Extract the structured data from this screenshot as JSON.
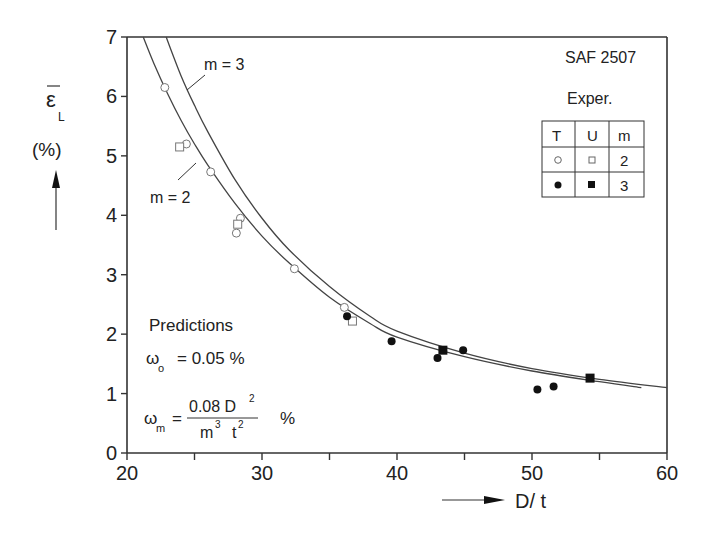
{
  "chart_data": {
    "type": "scatter",
    "title": "SAF 2507",
    "xlabel": "D/ t",
    "ylabel": "ε̄L (%)",
    "ylabel_symbol": "ε",
    "ylabel_sub": "L",
    "ylabel_unit": "(%)",
    "xlim": [
      20,
      60
    ],
    "ylim": [
      0,
      7
    ],
    "xticks": [
      20,
      30,
      40,
      50,
      60
    ],
    "yticks": [
      0,
      1,
      2,
      3,
      4,
      5,
      6,
      7
    ],
    "grid": false,
    "legend": {
      "title": "Exper.",
      "headers": [
        "T",
        "U",
        "m"
      ],
      "rows": [
        {
          "T": "open circle",
          "U": "open square",
          "m": "2"
        },
        {
          "T": "filled circle",
          "U": "filled square",
          "m": "3"
        }
      ],
      "position": "upper right"
    },
    "series": [
      {
        "name": "T, m = 2",
        "marker": "open-circle",
        "points": [
          [
            22.8,
            6.15
          ],
          [
            24.4,
            5.2
          ],
          [
            26.2,
            4.73
          ],
          [
            28.4,
            3.95
          ],
          [
            28.1,
            3.7
          ],
          [
            32.4,
            3.1
          ],
          [
            36.1,
            2.45
          ]
        ]
      },
      {
        "name": "U, m = 2",
        "marker": "open-square",
        "points": [
          [
            23.9,
            5.15
          ],
          [
            28.2,
            3.85
          ],
          [
            36.7,
            2.22
          ]
        ]
      },
      {
        "name": "T, m = 3",
        "marker": "filled-circle",
        "points": [
          [
            36.3,
            2.3
          ],
          [
            39.6,
            1.88
          ],
          [
            43.0,
            1.6
          ],
          [
            44.9,
            1.73
          ],
          [
            50.4,
            1.07
          ],
          [
            51.6,
            1.12
          ]
        ]
      },
      {
        "name": "U, m = 3",
        "marker": "filled-square",
        "points": [
          [
            43.4,
            1.73
          ],
          [
            54.3,
            1.26
          ]
        ]
      },
      {
        "name": "Prediction m = 2",
        "type": "line",
        "x": [
          21.2,
          22,
          23,
          24,
          25,
          26,
          28,
          30,
          32,
          35,
          38,
          40,
          45,
          50,
          55,
          58.1
        ],
        "y": [
          7.0,
          6.55,
          6.05,
          5.6,
          5.2,
          4.84,
          4.2,
          3.65,
          3.2,
          2.62,
          2.18,
          1.95,
          1.62,
          1.38,
          1.2,
          1.1
        ]
      },
      {
        "name": "Prediction m = 3",
        "type": "line",
        "x": [
          22.9,
          24,
          25,
          26,
          28,
          30,
          32,
          35,
          38,
          40,
          45,
          50,
          55,
          60
        ],
        "y": [
          7.0,
          6.35,
          5.85,
          5.4,
          4.6,
          3.95,
          3.42,
          2.8,
          2.3,
          2.05,
          1.68,
          1.42,
          1.24,
          1.1
        ]
      }
    ],
    "annotations": {
      "m3_label": "m = 3",
      "m2_label": "m = 2",
      "predictions_title": "Predictions",
      "omega_o_symbol": "ω",
      "omega_o_sub": "o",
      "omega_o_value": "= 0.05 %",
      "omega_m_symbol": "ω",
      "omega_m_sub": "m",
      "omega_m_eq": "=",
      "omega_m_numerator": "0.08 D",
      "omega_m_num_exp": "2",
      "omega_m_den_m": "m",
      "omega_m_den_m_exp": "3",
      "omega_m_den_t": "t",
      "omega_m_den_t_exp": "2",
      "omega_m_unit": "%"
    }
  }
}
